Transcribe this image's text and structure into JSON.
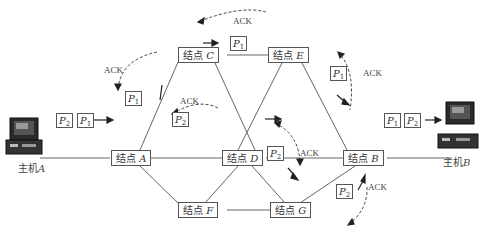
{
  "diagram": {
    "type": "packet-switched-network",
    "hosts": [
      {
        "id": "A",
        "label": "主机",
        "letter": "A"
      },
      {
        "id": "B",
        "label": "主机",
        "letter": "B"
      }
    ],
    "nodes": [
      {
        "id": "A",
        "label": "结点",
        "letter": "A"
      },
      {
        "id": "C",
        "label": "结点",
        "letter": "C"
      },
      {
        "id": "E",
        "label": "结点",
        "letter": "E"
      },
      {
        "id": "D",
        "label": "结点",
        "letter": "D"
      },
      {
        "id": "B",
        "label": "结点",
        "letter": "B"
      },
      {
        "id": "F",
        "label": "结点",
        "letter": "F"
      },
      {
        "id": "G",
        "label": "结点",
        "letter": "G"
      }
    ],
    "links": [
      [
        "HostA",
        "A"
      ],
      [
        "A",
        "C"
      ],
      [
        "A",
        "D"
      ],
      [
        "A",
        "F"
      ],
      [
        "C",
        "E"
      ],
      [
        "C",
        "D"
      ],
      [
        "E",
        "D"
      ],
      [
        "E",
        "B"
      ],
      [
        "D",
        "B"
      ],
      [
        "D",
        "F"
      ],
      [
        "D",
        "G"
      ],
      [
        "F",
        "G"
      ],
      [
        "G",
        "B"
      ],
      [
        "B",
        "HostB"
      ]
    ],
    "packets": {
      "p1": "P",
      "p1_sub": "1",
      "p2": "P",
      "p2_sub": "2"
    },
    "ack_label": "ACK",
    "routes": {
      "P1": [
        "A",
        "C",
        "E",
        "B"
      ],
      "P2": [
        "A",
        "D",
        "G",
        "B"
      ]
    }
  }
}
